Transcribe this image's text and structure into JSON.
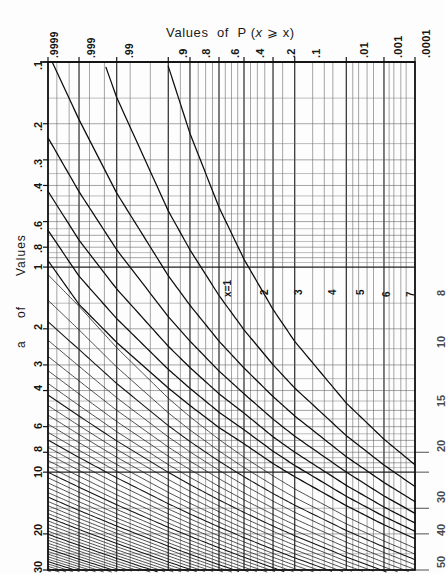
{
  "title": {
    "prefix": "Values  of  P (",
    "var_italic": "x",
    "relation": " ⩾ ",
    "arg": "x",
    "suffix": ")",
    "full": "Values  of  P ( x ⩾ x )"
  },
  "y_axis": {
    "label_line1": "Values",
    "label_line2": "of",
    "label_line3": "a",
    "label_full": "Values of a"
  },
  "top_axis": {
    "name": "Values of P(x ⩾ x)",
    "tick_labels": [
      ".9999",
      ".999",
      ".99",
      ".9",
      ".8",
      ".6",
      ".4",
      ".2",
      ".1",
      ".01",
      ".001",
      ".0001"
    ]
  },
  "left_axis": {
    "tick_labels": [
      ".1",
      ".2",
      ".3",
      ".4",
      ".6",
      ".8",
      "1",
      "2",
      "3",
      "4",
      "6",
      "8",
      "10",
      "20",
      "30"
    ]
  },
  "right_axis": {
    "tick_labels": [
      "8",
      "10",
      "15",
      "20",
      "30",
      "40",
      "50"
    ]
  },
  "curve_labels": [
    "x=1",
    "2",
    "3",
    "4",
    "5",
    "6",
    "7"
  ],
  "colors": {
    "background": "#fdfdfd",
    "ink": "#111111",
    "grid": "#2b2b2b",
    "grid_light": "#555555",
    "curve": "#0d0d0d"
  },
  "chart_data": {
    "type": "line",
    "subtitle": "",
    "xlabel": "Values of P(x ⩾ x)",
    "ylabel": "Values of a",
    "grid": true,
    "legend": "inline-curve-labels",
    "x_scale": "normal-probability (reversed, .9999 → .0001)",
    "y_scale": "logarithmic (reversed, .1 at top → 30 at bottom)",
    "xlim": [
      0.9999,
      0.0001
    ],
    "ylim": [
      0.1,
      30
    ],
    "x_ticks": [
      0.9999,
      0.999,
      0.99,
      0.9,
      0.8,
      0.6,
      0.4,
      0.2,
      0.1,
      0.01,
      0.001,
      0.0001
    ],
    "x_tick_labels": [
      ".9999",
      ".999",
      ".99",
      ".9",
      ".8",
      ".6",
      ".4",
      ".2",
      ".1",
      ".01",
      ".001",
      ".0001"
    ],
    "y_ticks": [
      0.1,
      0.2,
      0.3,
      0.4,
      0.6,
      0.8,
      1,
      2,
      3,
      4,
      6,
      8,
      10,
      20,
      30
    ],
    "y_tick_labels": [
      ".1",
      ".2",
      ".3",
      ".4",
      ".6",
      ".8",
      "1",
      "2",
      "3",
      "4",
      "6",
      "8",
      "10",
      "20",
      "30"
    ],
    "y_ticks_right": [
      8,
      10,
      15,
      20,
      30,
      40,
      50
    ],
    "y_tick_labels_right": [
      "8",
      "10",
      "15",
      "20",
      "30",
      "40",
      "50"
    ],
    "series": [
      {
        "name": "x=1",
        "p": [
          0.9999,
          0.999,
          0.99,
          0.9,
          0.8,
          0.6,
          0.4,
          0.2,
          0.1,
          0.01,
          0.001,
          0.0001
        ],
        "a": [
          0.0001,
          0.001,
          0.0101,
          0.105,
          0.223,
          0.511,
          0.916,
          1.609,
          2.303,
          4.605,
          6.908,
          9.21
        ]
      },
      {
        "name": "2",
        "p": [
          0.9999,
          0.999,
          0.99,
          0.9,
          0.8,
          0.6,
          0.4,
          0.2,
          0.1,
          0.01,
          0.001,
          0.0001
        ],
        "a": [
          0.0142,
          0.0454,
          0.149,
          0.532,
          0.824,
          1.376,
          2.022,
          2.994,
          3.89,
          6.638,
          9.233,
          11.76
        ]
      },
      {
        "name": "3",
        "p": [
          0.9999,
          0.999,
          0.99,
          0.9,
          0.8,
          0.6,
          0.4,
          0.2,
          0.1,
          0.01,
          0.001,
          0.0001
        ],
        "a": [
          0.0904,
          0.191,
          0.436,
          1.102,
          1.535,
          2.297,
          3.105,
          4.279,
          5.322,
          8.406,
          11.23,
          13.93
        ]
      },
      {
        "name": "4",
        "p": [
          0.9999,
          0.999,
          0.99,
          0.9,
          0.8,
          0.6,
          0.4,
          0.2,
          0.1,
          0.01,
          0.001,
          0.0001
        ],
        "a": [
          0.234,
          0.429,
          0.823,
          1.745,
          2.297,
          3.211,
          4.148,
          5.515,
          6.681,
          9.99,
          13.06,
          15.88
        ]
      },
      {
        "name": "5",
        "p": [
          0.9999,
          0.999,
          0.99,
          0.9,
          0.8,
          0.6,
          0.4,
          0.2,
          0.1,
          0.01,
          0.001,
          0.0001
        ],
        "a": [
          0.427,
          0.739,
          1.279,
          2.433,
          3.09,
          4.148,
          5.154,
          6.721,
          7.994,
          11.6,
          14.79,
          17.7
        ]
      },
      {
        "name": "6",
        "p": [
          0.9999,
          0.999,
          0.99,
          0.9,
          0.8,
          0.6,
          0.4,
          0.2,
          0.1,
          0.01,
          0.001,
          0.0001
        ],
        "a": [
          0.662,
          1.107,
          1.785,
          3.152,
          3.904,
          5.1,
          6.211,
          7.906,
          9.275,
          13.11,
          16.45,
          19.44
        ]
      },
      {
        "name": "7",
        "p": [
          0.9999,
          0.999,
          0.99,
          0.9,
          0.8,
          0.6,
          0.4,
          0.2,
          0.1,
          0.01,
          0.001,
          0.0001
        ],
        "a": [
          0.93,
          1.52,
          2.33,
          3.89,
          4.73,
          6.06,
          7.27,
          9.08,
          10.53,
          14.57,
          18.06,
          21.13
        ]
      }
    ]
  }
}
